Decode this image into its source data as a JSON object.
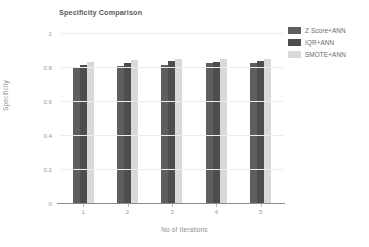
{
  "chart_data": {
    "type": "bar",
    "title": "Specificity Comparison",
    "xlabel": "No of Iterations",
    "ylabel": "Specificity",
    "categories": [
      "1",
      "2",
      "3",
      "4",
      "5"
    ],
    "series": [
      {
        "name": "Z Score+ANN",
        "color": "#5e5e5e",
        "values": [
          0.795,
          0.805,
          0.812,
          0.824,
          0.823
        ]
      },
      {
        "name": "IQR+ANN",
        "color": "#4d4d4d",
        "values": [
          0.812,
          0.826,
          0.834,
          0.832,
          0.833
        ]
      },
      {
        "name": "SMOTE+ANN",
        "color": "#d9d9d9",
        "values": [
          0.83,
          0.842,
          0.849,
          0.847,
          0.849
        ]
      }
    ],
    "ylim": [
      0,
      1
    ],
    "yticks": [
      "0",
      "0.2",
      "0.4",
      "0.6",
      "0.8",
      "1"
    ],
    "ytick_values": [
      0,
      0.2,
      0.4,
      0.6,
      0.8,
      1
    ],
    "grid": true,
    "legend_position": "top-right"
  },
  "colors": {
    "series_1": "#5e5e5e",
    "series_2": "#4d4d4d",
    "series_3": "#d9d9d9",
    "gridline": "#ececec",
    "axis": "#8c8c8c",
    "tick_text": "#9a9a9a",
    "title_text": "#5a5a5a",
    "background": "#ffffff"
  }
}
